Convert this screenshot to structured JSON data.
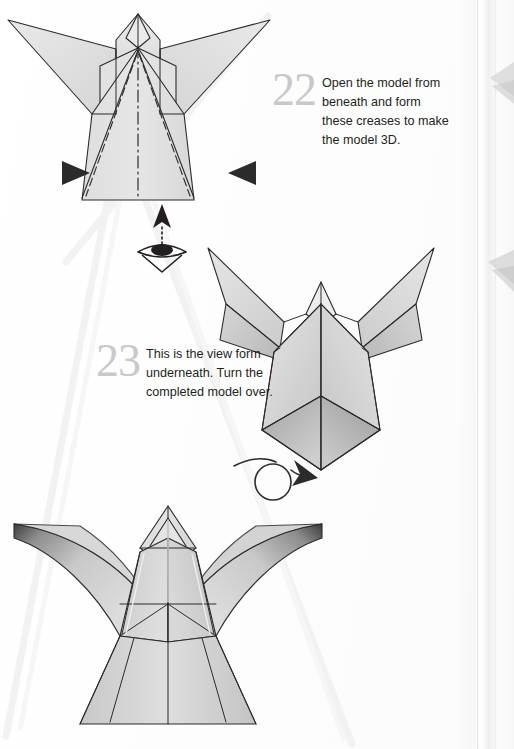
{
  "page": {
    "background_color": "#ffffff",
    "width": 514,
    "height": 749
  },
  "steps": [
    {
      "number": "22",
      "text": "Open the model from beneath and form these creases to make the model 3D."
    },
    {
      "number": "23",
      "text": "This is the view form underneath. Turn the completed model over."
    }
  ],
  "figures": [
    {
      "id": "fig-top",
      "caption": "Flat angel model with wings, showing valley creases and a mountain centre line",
      "paper_fill": "#e3e3e3",
      "line_color": "#2b2b2b"
    },
    {
      "id": "fig-middle",
      "caption": "Three-dimensional model viewed from underneath with open hollow base",
      "paper_fill": "#dedede",
      "shadow_fill": "#9b9b9b",
      "line_color": "#2b2b2b"
    },
    {
      "id": "fig-bottom",
      "caption": "Completed three-dimensional angel model with curved wings",
      "paper_fill": "#d9d9d9",
      "shadow_fill": "#4a4a4a",
      "line_color": "#2b2b2b"
    }
  ],
  "symbols": [
    {
      "id": "arrow-left",
      "name": "push-arrow-right",
      "color": "#2b2b2b"
    },
    {
      "id": "arrow-right",
      "name": "push-arrow-left",
      "color": "#2b2b2b"
    },
    {
      "id": "sym-eye",
      "name": "view-from-direction-eye",
      "color": "#231f20"
    },
    {
      "id": "sym-turnover",
      "name": "turn-model-over-arrow",
      "color": "#2b2b2b"
    }
  ],
  "colors": {
    "step_number": "#c9c9c9",
    "body_text": "#231f20",
    "paper_light": "#e8e8e8",
    "paper_mid": "#cfcfcf",
    "paper_dark": "#9a9a9a",
    "outline": "#2b2b2b",
    "watermark": "#f1f1f1",
    "page_edge": "#e2e2e2"
  }
}
